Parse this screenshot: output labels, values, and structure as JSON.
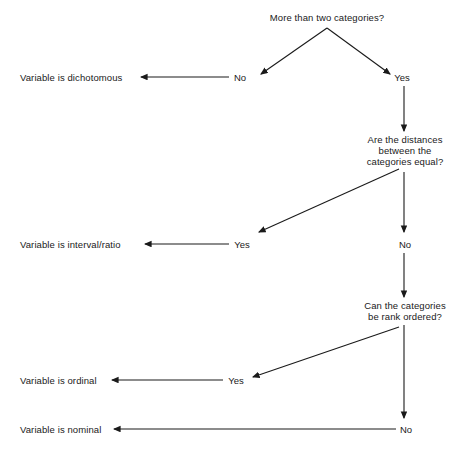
{
  "diagram": {
    "title_semantic": "levels-of-measurement-decision-tree",
    "background_color": "#ffffff",
    "line_color": "#1a1a1a",
    "text_color": "#1a1a1a",
    "questions": [
      {
        "id": "q1",
        "lines": [
          "More than two categories?"
        ],
        "x": 327,
        "y": 12
      },
      {
        "id": "q2",
        "lines": [
          "Are the distances",
          "between the",
          "categories equal?"
        ],
        "x": 405,
        "y": 134
      },
      {
        "id": "q3",
        "lines": [
          "Can the categories",
          "be rank ordered?"
        ],
        "x": 405,
        "y": 300
      }
    ],
    "outcomes": [
      {
        "id": "o1",
        "text": "Variable is dichotomous",
        "x": 20,
        "y": 72
      },
      {
        "id": "o2",
        "text": "Variable is interval/ratio",
        "x": 20,
        "y": 239
      },
      {
        "id": "o3",
        "text": "Variable is ordinal",
        "x": 20,
        "y": 375
      },
      {
        "id": "o4",
        "text": "Variable is nominal",
        "x": 20,
        "y": 424
      }
    ],
    "edge_labels": [
      {
        "id": "e1",
        "text": "No",
        "x": 240,
        "y": 72
      },
      {
        "id": "e2",
        "text": "Yes",
        "x": 402,
        "y": 72
      },
      {
        "id": "e3",
        "text": "Yes",
        "x": 242,
        "y": 239
      },
      {
        "id": "e4",
        "text": "No",
        "x": 405,
        "y": 239
      },
      {
        "id": "e5",
        "text": "Yes",
        "x": 236,
        "y": 375
      },
      {
        "id": "e6",
        "text": "No",
        "x": 406,
        "y": 424
      }
    ]
  }
}
